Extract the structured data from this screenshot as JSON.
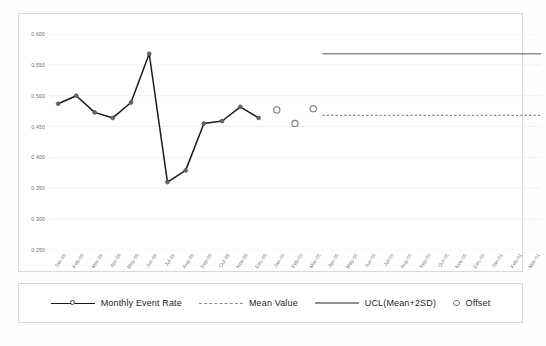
{
  "chart_data": {
    "type": "line",
    "title": "",
    "xlabel": "",
    "ylabel": "",
    "ylim": [
      0.25,
      0.6
    ],
    "ytick_values": [
      0.6,
      0.55,
      0.5,
      0.45,
      0.4,
      0.35,
      0.3,
      0.25
    ],
    "ytick_labels": [
      "0.600",
      "0.550",
      "0.500",
      "0.450",
      "0.400",
      "0.350",
      "0.300",
      "0.250"
    ],
    "grid": true,
    "grid_axis": "y",
    "legend_position": "bottom",
    "categories": [
      "Jan-99",
      "Feb-99",
      "Mar-99",
      "Apr-99",
      "May-99",
      "Jun-99",
      "Jul-99",
      "Aug-99",
      "Sep-99",
      "Oct-99",
      "Nov-99",
      "Dec-99",
      "Jan-00",
      "Feb-00",
      "Mar-00",
      "Apr-00",
      "May-00",
      "Jun-00",
      "Jul-00",
      "Aug-00",
      "Sep-00",
      "Oct-00",
      "Nov-00",
      "Dec-00",
      "Jan-01",
      "Feb-01",
      "Mar-01"
    ],
    "series": [
      {
        "name": "Monthly Event Rate",
        "type": "line",
        "marker": "filled-circle",
        "color": "#1a1a1a",
        "values": [
          0.487,
          0.5,
          0.473,
          0.464,
          0.489,
          0.568,
          0.36,
          0.379,
          0.455,
          0.459,
          0.482,
          0.464,
          null,
          null,
          null,
          null,
          null,
          null,
          null,
          null,
          null,
          null,
          null,
          null,
          null,
          null,
          null
        ]
      },
      {
        "name": "Offset",
        "type": "scatter",
        "marker": "open-circle",
        "color": "#777777",
        "values": [
          null,
          null,
          null,
          null,
          null,
          null,
          null,
          null,
          null,
          null,
          null,
          null,
          0.477,
          0.455,
          0.479,
          null,
          null,
          null,
          null,
          null,
          null,
          null,
          null,
          null,
          null,
          null,
          null
        ]
      },
      {
        "name": "Mean Value",
        "type": "reference-line",
        "style": "dashed",
        "color": "#8a8a8a",
        "value": 0.468,
        "span_from": "Apr-00",
        "span_to": "Mar-01"
      },
      {
        "name": "UCL(Mean+2SD)",
        "type": "reference-line",
        "style": "solid",
        "color": "#8f8f8f",
        "value": 0.568,
        "span_from": "Apr-00",
        "span_to": "Mar-01"
      }
    ]
  },
  "legend": {
    "items": [
      {
        "label": "Monthly Event  Rate",
        "key": "line-marker-key"
      },
      {
        "label": "Mean Value",
        "key": "dashed-line-key"
      },
      {
        "label": "UCL(Mean+2SD)",
        "key": "solid-line-key"
      },
      {
        "label": "Offset",
        "key": "open-circle-key"
      }
    ]
  }
}
